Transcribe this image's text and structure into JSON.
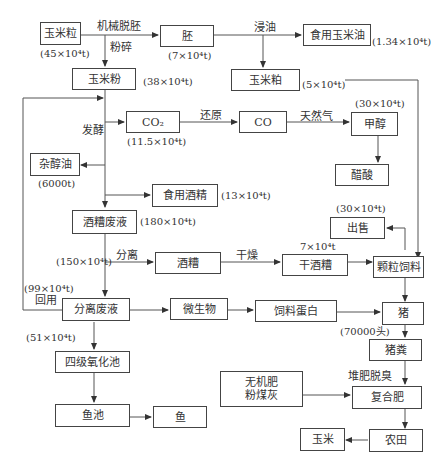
{
  "diagram": {
    "nodes": {
      "corn_grain": "玉米粒",
      "germ": "胚",
      "edible_corn_oil": "食用玉米油",
      "corn_flour": "玉米粉",
      "corn_meal": "玉米粕",
      "co2": "CO₂",
      "co": "CO",
      "methanol": "甲醇",
      "acetic_acid": "醋酸",
      "fusel_oil": "杂醇油",
      "edible_alcohol": "食用酒精",
      "distillery_waste": "酒糟废液",
      "sale": "出售",
      "distillers_grains": "酒糟",
      "dried_grains": "干酒糟",
      "pellet_feed": "颗粒饲料",
      "separated_waste": "分离废液",
      "microbes": "微生物",
      "feed_protein": "饲料蛋白",
      "pig": "猪",
      "pig_manure": "猪粪",
      "oxidation_pond": "四级氧化池",
      "inorganic_fertilizer": "无机肥\n粉煤灰",
      "compound_fertilizer": "复合肥",
      "fish_pond": "鱼池",
      "fish": "鱼",
      "corn": "玉米",
      "farmland": "农田"
    },
    "edge_labels": {
      "mechanical_degerm": "机械脱胚",
      "crush": "粉碎",
      "oil_extract": "浸油",
      "reduction": "还原",
      "natural_gas": "天然气",
      "ferment": "发酵",
      "separate": "分离",
      "dry": "干燥",
      "reuse": "回用",
      "compost_deodorize": "堆肥脱臭"
    },
    "quantities": {
      "corn_grain": "(45×10⁴t)",
      "germ": "(7×10⁴t)",
      "edible_corn_oil": "(1.34×10⁴t)",
      "corn_flour": "(38×10⁴t)",
      "corn_meal": "(5×10⁴t)",
      "methanol": "(30×10⁴t)",
      "co2": "(11.5×10⁴t)",
      "fusel_oil": "(6000t)",
      "edible_alcohol": "(13×10⁴t)",
      "distillery_waste": "(180×10⁴t)",
      "sale": "(30×10⁴t)",
      "separation_flow": "(150×10⁴t)",
      "dried_grains": "7×10⁴t",
      "reuse_flow": "(99×10⁴t)",
      "oxidation_flow": "(51×10⁴t)",
      "pig": "(70000头)"
    }
  }
}
